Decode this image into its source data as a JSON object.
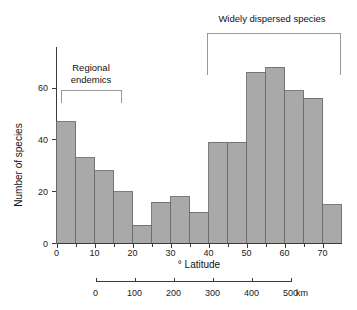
{
  "chart_data": {
    "type": "bar",
    "title": "",
    "xlabel": "° Latitude",
    "ylabel": "Number of species",
    "categories": [
      "0-5",
      "5-10",
      "10-15",
      "15-20",
      "20-25",
      "25-30",
      "30-35",
      "35-40",
      "40-45",
      "45-50",
      "50-55",
      "55-60",
      "60-65",
      "65-70",
      "70-75"
    ],
    "bin_starts": [
      0,
      5,
      10,
      15,
      20,
      25,
      30,
      35,
      40,
      45,
      50,
      55,
      60,
      65,
      70
    ],
    "bin_width": 5,
    "values": [
      47,
      33,
      28,
      20,
      7,
      16,
      18,
      12,
      39,
      39,
      66,
      68,
      59,
      56,
      15
    ],
    "xlim": [
      0,
      75
    ],
    "ylim": [
      0,
      72
    ],
    "x_ticks": [
      0,
      10,
      20,
      30,
      40,
      50,
      60,
      70
    ],
    "x_tick_labels": [
      "0",
      "10",
      "20",
      "30",
      "40",
      "50",
      "60",
      "70"
    ],
    "x_minor_ticks": [
      5,
      15,
      25,
      35,
      45,
      55,
      65
    ],
    "y_ticks": [
      0,
      20,
      40,
      60
    ],
    "y_tick_labels": [
      "0",
      "20",
      "40",
      "60"
    ],
    "grid": false,
    "legend": "none",
    "bar_fill": "#a9a9a9",
    "bar_stroke": "#6e6e6e",
    "secondary_axis": {
      "label": "km",
      "unit_text": "km",
      "ticks": [
        0,
        100,
        200,
        300,
        400,
        500
      ],
      "tick_labels": [
        "0",
        "100",
        "200",
        "300",
        "400",
        "500"
      ]
    },
    "annotations": [
      {
        "id": "regional-endemics",
        "text_line1": "Regional",
        "text_line2": "endemics",
        "bracket_from_deg": 0,
        "bracket_to_deg": 15
      },
      {
        "id": "widely-dispersed",
        "text_line1": "Widely dispersed species",
        "text_line2": "",
        "bracket_from_deg": 40,
        "bracket_to_deg": 75
      }
    ]
  },
  "axes": {
    "y_title": "Number of species",
    "x_title": "° Latitude"
  }
}
